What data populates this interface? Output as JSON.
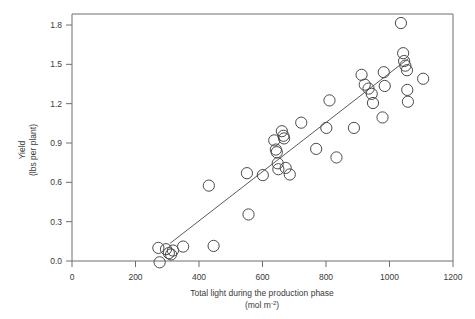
{
  "chart_data": {
    "type": "scatter",
    "title": "",
    "xlabel": "Total light during the production phase",
    "xlabel_units": "(mol m-2)",
    "xlabel_units_base": "(mol m",
    "xlabel_units_exp": "-2",
    "xlabel_units_close": ")",
    "ylabel_line1": "Yield",
    "ylabel_line2": "(lbs per plant)",
    "xlim": [
      0,
      1200
    ],
    "ylim": [
      0.0,
      1.8
    ],
    "xticks": [
      0,
      200,
      400,
      600,
      800,
      1000,
      1200
    ],
    "xtick_labels": [
      "0",
      "200",
      "400",
      "600",
      "800",
      "1000",
      "1200"
    ],
    "yticks": [
      0.0,
      0.3,
      0.6,
      0.9,
      1.2,
      1.5,
      1.8
    ],
    "ytick_labels": [
      "0.0",
      "0.3",
      "0.6",
      "0.9",
      "1.2",
      "1.5",
      "1.8"
    ],
    "grid": false,
    "legend": "none",
    "marker_style": "open-circle",
    "marker_radius_px": 5.6,
    "points": [
      {
        "x": 272,
        "y": 0.1
      },
      {
        "x": 276,
        "y": -0.01
      },
      {
        "x": 296,
        "y": 0.09
      },
      {
        "x": 305,
        "y": 0.06
      },
      {
        "x": 312,
        "y": 0.05
      },
      {
        "x": 318,
        "y": 0.08
      },
      {
        "x": 350,
        "y": 0.11
      },
      {
        "x": 431,
        "y": 0.575
      },
      {
        "x": 446,
        "y": 0.115
      },
      {
        "x": 551,
        "y": 0.67
      },
      {
        "x": 556,
        "y": 0.355
      },
      {
        "x": 601,
        "y": 0.655
      },
      {
        "x": 637,
        "y": 0.92
      },
      {
        "x": 642,
        "y": 0.85
      },
      {
        "x": 645,
        "y": 0.83
      },
      {
        "x": 648,
        "y": 0.745
      },
      {
        "x": 650,
        "y": 0.7
      },
      {
        "x": 661,
        "y": 0.99
      },
      {
        "x": 666,
        "y": 0.955
      },
      {
        "x": 668,
        "y": 0.935
      },
      {
        "x": 673,
        "y": 0.71
      },
      {
        "x": 686,
        "y": 0.66
      },
      {
        "x": 722,
        "y": 1.055
      },
      {
        "x": 769,
        "y": 0.855
      },
      {
        "x": 801,
        "y": 1.015
      },
      {
        "x": 811,
        "y": 1.225
      },
      {
        "x": 833,
        "y": 0.79
      },
      {
        "x": 888,
        "y": 1.015
      },
      {
        "x": 912,
        "y": 1.42
      },
      {
        "x": 922,
        "y": 1.345
      },
      {
        "x": 934,
        "y": 1.315
      },
      {
        "x": 944,
        "y": 1.275
      },
      {
        "x": 948,
        "y": 1.205
      },
      {
        "x": 978,
        "y": 1.095
      },
      {
        "x": 982,
        "y": 1.44
      },
      {
        "x": 985,
        "y": 1.335
      },
      {
        "x": 1036,
        "y": 1.815
      },
      {
        "x": 1043,
        "y": 1.585
      },
      {
        "x": 1046,
        "y": 1.525
      },
      {
        "x": 1050,
        "y": 1.49
      },
      {
        "x": 1055,
        "y": 1.455
      },
      {
        "x": 1056,
        "y": 1.305
      },
      {
        "x": 1058,
        "y": 1.215
      },
      {
        "x": 1106,
        "y": 1.39
      }
    ],
    "fit_line": {
      "label": "linear regression line",
      "x_start": 309,
      "y_start": 0.135,
      "x_end": 1060,
      "y_end": 1.545
    }
  }
}
